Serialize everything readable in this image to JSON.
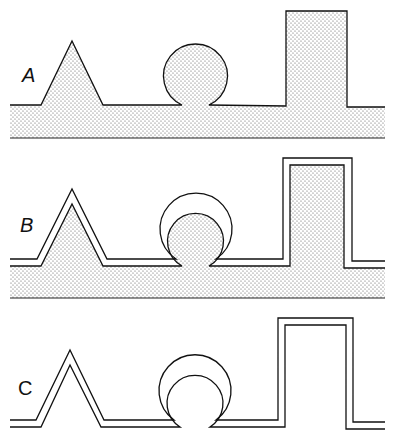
{
  "panels": [
    {
      "id": "A",
      "label": "A",
      "description": "Stippled surface with bumps"
    },
    {
      "id": "B",
      "label": "B",
      "description": "Stippled surface coated with a uniform layer"
    },
    {
      "id": "C",
      "label": "C",
      "description": "Isolated coating layer only"
    }
  ],
  "colors": {
    "stroke": "#111111",
    "fill_dots": "#555555",
    "background": "#ffffff"
  }
}
